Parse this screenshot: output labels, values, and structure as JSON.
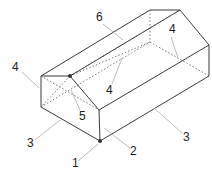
{
  "figure": {
    "type": "isometric line drawing of a gable-roof block",
    "colors": {
      "edge": "#3a3a3a",
      "leader": "#aaaaaa",
      "label": "#222222"
    }
  },
  "labels": [
    {
      "id": "l1",
      "text": "1",
      "x": 72,
      "y": 167
    },
    {
      "id": "l2",
      "text": "2",
      "x": 130,
      "y": 155
    },
    {
      "id": "l3a",
      "text": "3",
      "x": 27,
      "y": 147
    },
    {
      "id": "l3b",
      "text": "3",
      "x": 183,
      "y": 141
    },
    {
      "id": "l4a",
      "text": "4",
      "x": 12,
      "y": 71
    },
    {
      "id": "l4b",
      "text": "4",
      "x": 106,
      "y": 94
    },
    {
      "id": "l4c",
      "text": "4",
      "x": 169,
      "y": 33
    },
    {
      "id": "l5",
      "text": "5",
      "x": 79,
      "y": 120
    },
    {
      "id": "l6",
      "text": "6",
      "x": 96,
      "y": 21
    }
  ]
}
